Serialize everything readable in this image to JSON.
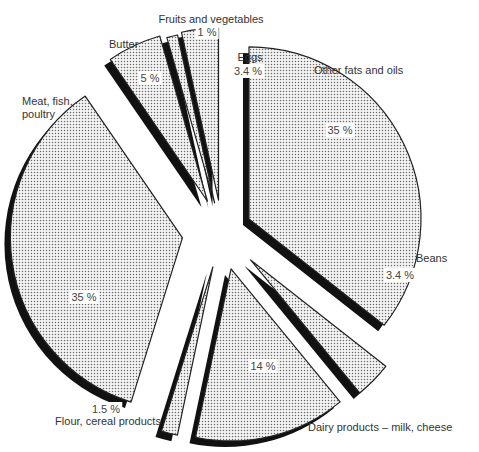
{
  "chart_data": {
    "type": "pie",
    "style": "exploded-3d",
    "title": "",
    "slices": [
      {
        "label": "Other fats and oils",
        "value": 35,
        "value_label": "35 %"
      },
      {
        "label": "Beans",
        "value": 3.4,
        "value_label": "3.4 %"
      },
      {
        "label": "Dairy products – milk, cheese",
        "value": 14,
        "value_label": "14 %"
      },
      {
        "label": "Flour, cereal products",
        "value": 1.5,
        "value_label": "1.5 %"
      },
      {
        "label": "Meat, fish, poultry",
        "value": 35,
        "value_label": "35 %"
      },
      {
        "label": "Butter",
        "value": 5,
        "value_label": "5 %"
      },
      {
        "label": "Fruits and vegetables",
        "value": 1,
        "value_label": "1 %"
      },
      {
        "label": "Eggs",
        "value": 3.4,
        "value_label": "3.4 %"
      }
    ],
    "fill_pattern": "dotted-gray",
    "shadow_color": "#111111",
    "outline_color": "#222222",
    "legend": "none"
  }
}
